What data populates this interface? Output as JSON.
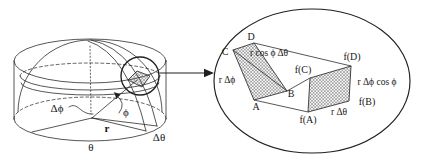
{
  "colors": {
    "ink": "#1f1f1f",
    "paper": "#ffffff"
  },
  "main_sketch": {
    "labels": {
      "delta_phi": "Δϕ",
      "phi": "ϕ",
      "r": "r",
      "delta_theta": "Δθ",
      "theta": "θ"
    }
  },
  "detail_view": {
    "corners": {
      "A": "A",
      "B": "B",
      "C": "C",
      "D": "D"
    },
    "heights": {
      "fA": "f(A)",
      "fB": "f(B)",
      "fC": "f(C)",
      "fD": "f(D)"
    },
    "edges": {
      "top": "r cos ϕ Δθ",
      "left": "r Δϕ",
      "right": "r Δϕ cos ϕ",
      "bottom": "r Δθ"
    }
  }
}
